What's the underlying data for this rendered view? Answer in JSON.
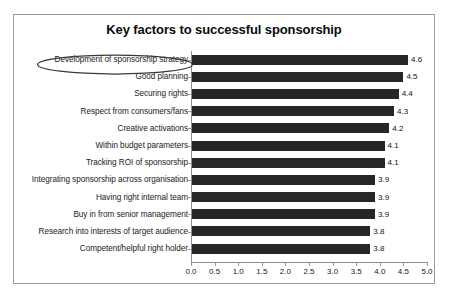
{
  "chart_data": {
    "type": "bar",
    "orientation": "horizontal",
    "title": "Key factors to successful sponsorship",
    "xlabel": "",
    "ylabel": "",
    "xlim": [
      0.0,
      5.0
    ],
    "grid": false,
    "legend": null,
    "bar_color": "#262626",
    "border_color": "#9a9a9a",
    "categories": [
      "Development of sponsorship strategy",
      "Good planning",
      "Securing rights",
      "Respect from consumers/fans",
      "Creative activations",
      "Within budget parameters",
      "Tracking ROI of sponsorship",
      "Integrating sponsorship across organisation",
      "Having right internal team",
      "Buy in from senior management",
      "Research into interests of target audience",
      "Competent/helpful right holder"
    ],
    "values": [
      4.6,
      4.5,
      4.4,
      4.3,
      4.2,
      4.1,
      4.1,
      3.9,
      3.9,
      3.9,
      3.8,
      3.8
    ],
    "value_labels": [
      "4.6",
      "4.5",
      "4.4",
      "4.3",
      "4.2",
      "4.1",
      "4.1",
      "3.9",
      "3.9",
      "3.9",
      "3.8",
      "3.8"
    ],
    "xticks": [
      0.0,
      0.5,
      1.0,
      1.5,
      2.0,
      2.5,
      3.0,
      3.5,
      4.0,
      4.5,
      5.0
    ],
    "xtick_labels": [
      "0.0",
      "0.5",
      "1.0",
      "1.5",
      "2.0",
      "2.5",
      "3.0",
      "3.5",
      "4.0",
      "4.5",
      "5.0"
    ],
    "annotations": [
      {
        "type": "ellipse",
        "target": "Development of sponsorship strategy",
        "color": "#3a3a3a"
      }
    ]
  }
}
